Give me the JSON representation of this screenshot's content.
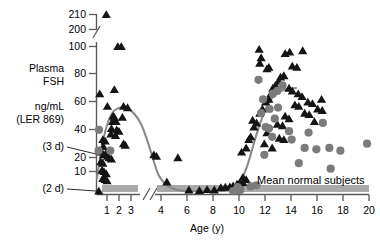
{
  "chart_data": {
    "type": "scatter",
    "title": "",
    "xlabel": "Age (y)",
    "ylabel_lines": [
      "Plasma",
      "FSH",
      "ng/mL",
      "(LER 869)"
    ],
    "ylabel_full": "Plasma FSH ng/mL (LER 869)",
    "grid": false,
    "legend_position": "inside-bottom-right",
    "x_axis": {
      "ticks": [
        1,
        2,
        3,
        4,
        6,
        8,
        10,
        12,
        14,
        16,
        18,
        20
      ],
      "tick_labels": [
        "1",
        "2",
        "3",
        "4",
        "6",
        "8",
        "10",
        "12",
        "14",
        "16",
        "18",
        "20"
      ],
      "break_between": [
        3,
        4
      ],
      "xlim": [
        0,
        20
      ],
      "units": "years"
    },
    "y_axis": {
      "ticks": [
        10,
        20,
        40,
        60,
        80,
        100,
        200,
        210
      ],
      "tick_labels": [
        "10",
        "20",
        "40",
        "60",
        "80",
        "100",
        "200",
        "210"
      ],
      "break_between": [
        100,
        200
      ],
      "ylim": [
        0,
        210
      ],
      "units": "ng/mL"
    },
    "annotations": [
      {
        "label": "(3 d)",
        "value_y": 25,
        "note": "3 days of age sample"
      },
      {
        "label": "(2 d)",
        "value_y": 1.5,
        "note": "2 days of age sample"
      }
    ],
    "legend": [
      {
        "label": "Mean normal subjects",
        "marker": "gray-bar",
        "color": "#a9a9a9"
      }
    ],
    "series": [
      {
        "name": "Triangles",
        "marker": "triangle",
        "color": "#141414",
        "points": [
          [
            0.85,
            210
          ],
          [
            1.85,
            100
          ],
          [
            2.15,
            100
          ],
          [
            0.28,
            66
          ],
          [
            1.55,
            69
          ],
          [
            0.95,
            57
          ],
          [
            2.35,
            57
          ],
          [
            2.7,
            56
          ],
          [
            1.45,
            50
          ],
          [
            1.55,
            49
          ],
          [
            1.4,
            46
          ],
          [
            1.7,
            46
          ],
          [
            2.25,
            49
          ],
          [
            1.3,
            41
          ],
          [
            1.75,
            40
          ],
          [
            1.95,
            39
          ],
          [
            1.25,
            37
          ],
          [
            1.65,
            36
          ],
          [
            0.55,
            33
          ],
          [
            0.75,
            32
          ],
          [
            0.6,
            28
          ],
          [
            2.35,
            30
          ],
          [
            2.5,
            29
          ],
          [
            0.3,
            25
          ],
          [
            0.45,
            24
          ],
          [
            0.62,
            22
          ],
          [
            0.8,
            23
          ],
          [
            0.95,
            21
          ],
          [
            1.1,
            20
          ],
          [
            1.3,
            19
          ],
          [
            0.38,
            17
          ],
          [
            0.55,
            16
          ],
          [
            3.45,
            22
          ],
          [
            3.65,
            21
          ],
          [
            5.3,
            20
          ],
          [
            0.48,
            11
          ],
          [
            0.65,
            10
          ],
          [
            0.85,
            9
          ],
          [
            0.55,
            7
          ],
          [
            0.75,
            6.5
          ],
          [
            0.92,
            6
          ],
          [
            0.2,
            1.5
          ],
          [
            4.45,
            5.5
          ],
          [
            6.15,
            2.0
          ],
          [
            6.95,
            1.8
          ],
          [
            7.55,
            2.2
          ],
          [
            8.1,
            2.0
          ],
          [
            8.6,
            3.0
          ],
          [
            8.95,
            3.2
          ],
          [
            9.3,
            3.4
          ],
          [
            9.55,
            3.8
          ],
          [
            9.85,
            4.5
          ],
          [
            10.05,
            5.0
          ],
          [
            10.3,
            5.2
          ],
          [
            10.55,
            6.5
          ],
          [
            10.3,
            7.5
          ],
          [
            10.2,
            24
          ],
          [
            10.55,
            27
          ],
          [
            10.75,
            33
          ],
          [
            10.9,
            35
          ],
          [
            11.15,
            42
          ],
          [
            11.35,
            45
          ],
          [
            11.05,
            47
          ],
          [
            11.6,
            52
          ],
          [
            11.8,
            55
          ],
          [
            12.05,
            60
          ],
          [
            12.3,
            62
          ],
          [
            12.45,
            66
          ],
          [
            12.6,
            70
          ],
          [
            12.8,
            72
          ],
          [
            13.05,
            75
          ],
          [
            13.2,
            78
          ],
          [
            13.45,
            79
          ],
          [
            12.15,
            84
          ],
          [
            12.3,
            85
          ],
          [
            11.6,
            88
          ],
          [
            11.7,
            92
          ],
          [
            11.55,
            98
          ],
          [
            13.55,
            95
          ],
          [
            13.9,
            96
          ],
          [
            14.9,
            97
          ],
          [
            14.1,
            86
          ],
          [
            14.45,
            85
          ],
          [
            13.85,
            70
          ],
          [
            14.1,
            68
          ],
          [
            14.55,
            66
          ],
          [
            14.85,
            64
          ],
          [
            14.3,
            58
          ],
          [
            14.6,
            57
          ],
          [
            13.55,
            50
          ],
          [
            13.85,
            48
          ],
          [
            12.95,
            44
          ],
          [
            13.35,
            43
          ],
          [
            15.3,
            60
          ],
          [
            15.65,
            59
          ],
          [
            15.05,
            52
          ],
          [
            15.4,
            51
          ],
          [
            16.35,
            62
          ],
          [
            13.1,
            34
          ],
          [
            13.45,
            33
          ],
          [
            12.15,
            38
          ],
          [
            16.05,
            55
          ],
          [
            16.4,
            54
          ],
          [
            11.95,
            30
          ],
          [
            12.55,
            27
          ],
          [
            15.8,
            46
          ]
        ]
      },
      {
        "name": "Circles",
        "marker": "circle",
        "color": "#7b7b7b",
        "points": [
          [
            0.22,
            40
          ],
          [
            0.18,
            25
          ],
          [
            1.2,
            25
          ],
          [
            9.55,
            1.5
          ],
          [
            9.8,
            1.8
          ],
          [
            10.1,
            2.0
          ],
          [
            9.9,
            3.2
          ],
          [
            10.9,
            3.5
          ],
          [
            11.35,
            4.0
          ],
          [
            11.95,
            22
          ],
          [
            12.55,
            35
          ],
          [
            12.05,
            42
          ],
          [
            12.3,
            41
          ],
          [
            11.7,
            52
          ],
          [
            12.35,
            55
          ],
          [
            11.85,
            62
          ],
          [
            12.6,
            66
          ],
          [
            12.95,
            68
          ],
          [
            13.35,
            72
          ],
          [
            13.0,
            56
          ],
          [
            12.75,
            48
          ],
          [
            13.85,
            39
          ],
          [
            15.35,
            38
          ],
          [
            11.5,
            76
          ],
          [
            14.05,
            33
          ],
          [
            15.05,
            27
          ],
          [
            15.95,
            26
          ],
          [
            16.95,
            27
          ],
          [
            17.8,
            25
          ],
          [
            19.85,
            30
          ],
          [
            16.45,
            45
          ],
          [
            14.6,
            16
          ],
          [
            17.05,
            12
          ]
        ]
      }
    ],
    "fit_curves": [
      {
        "name": "infancy-peak-and-puberty-rise",
        "color": "#8a8a8a",
        "description": "Smoothed mean FSH: infant peak ~55 ng/mL near 1.5 y, nadir ~2 ng/mL from 5-9 y, pubertal rise to plateau ~67 ng/mL by 14 y"
      }
    ],
    "normal_bars": [
      {
        "x_start": 0.55,
        "x_end": 3.1,
        "label": "Mean normal subjects"
      },
      {
        "x_start": 4.0,
        "x_end": 20.0,
        "label": "Mean normal subjects"
      }
    ]
  }
}
